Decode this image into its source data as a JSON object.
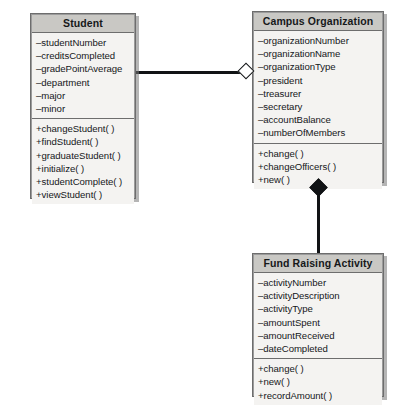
{
  "diagram": {
    "kind": "uml-class-diagram",
    "background_color": "#ffffff",
    "title_bar_color": "#c9c8c4",
    "body_color": "#f4f3f1",
    "border_color": "#6d6d6d",
    "line_color": "#111315",
    "caption": "",
    "classes": [
      {
        "id": "student",
        "name": "Student",
        "attributes": [
          "–studentNumber",
          "–creditsCompleted",
          "–gradePointAverage",
          "–department",
          "–major",
          "–minor"
        ],
        "operations": [
          "+changeStudent( )",
          "+findStudent( )",
          "+graduateStudent( )",
          "+initialize( )",
          "+studentComplete( )",
          "+viewStudent( )"
        ]
      },
      {
        "id": "campus-organization",
        "name": "Campus Organization",
        "attributes": [
          "–organizationNumber",
          "–organizationName",
          "–organizationType",
          "–president",
          "–treasurer",
          "–secretary",
          "–accountBalance",
          "–numberOfMembers"
        ],
        "operations": [
          "+change( )",
          "+changeOfficers( )",
          "+new( )"
        ]
      },
      {
        "id": "fund-raising-activity",
        "name": "Fund Raising Activity",
        "attributes": [
          "–activityNumber",
          "–activityDescription",
          "–activityType",
          "–amountSpent",
          "–amountReceived",
          "–dateCompleted"
        ],
        "operations": [
          "+change( )",
          "+new( )",
          "+recordAmount( )"
        ]
      }
    ],
    "relationships": [
      {
        "id": "student-to-campus-organization",
        "type": "aggregation",
        "marker": "hollow-diamond",
        "from": "Student",
        "to": "Campus Organization"
      },
      {
        "id": "campus-organization-to-fund-raising-activity",
        "type": "composition",
        "marker": "filled-diamond",
        "from": "Campus Organization",
        "to": "Fund Raising Activity"
      }
    ]
  }
}
